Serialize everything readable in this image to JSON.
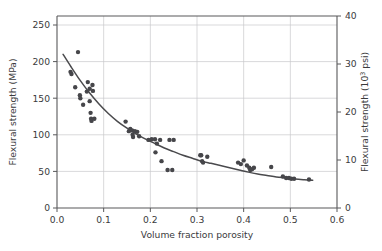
{
  "chart_data": {
    "type": "scatter",
    "title": "",
    "xlabel": "Volume fraction porosity",
    "ylabel_left": "Flexural strength (MPa)",
    "ylabel_right": "Flexural strength (10³ psi)",
    "ylabel_right_base": "Flexural strength (10",
    "ylabel_right_exp": "3",
    "ylabel_right_tail": " psi)",
    "xlim": [
      0.0,
      0.6
    ],
    "ylim_left": [
      0,
      250
    ],
    "ylim_right": [
      0,
      40
    ],
    "grid": true,
    "legend": "none",
    "xticks": [
      0.0,
      0.1,
      0.2,
      0.3,
      0.4,
      0.5,
      0.6
    ],
    "xticklabels": [
      "0.0",
      "0.1",
      "0.2",
      "0.3",
      "0.4",
      "0.5",
      "0.6"
    ],
    "yticks_left": [
      0,
      50,
      100,
      150,
      200,
      250
    ],
    "yticklabels_left": [
      "0",
      "50",
      "100",
      "150",
      "200",
      "250"
    ],
    "yticks_right": [
      0,
      10,
      20,
      30,
      40
    ],
    "yticklabels_right": [
      "0",
      "10",
      "20",
      "30",
      "40"
    ],
    "series": [
      {
        "name": "Flexural strength vs porosity",
        "marker": "circle",
        "color": "#46464a",
        "points": [
          [
            0.029,
            186.0
          ],
          [
            0.031,
            183.0
          ],
          [
            0.039,
            165.0
          ],
          [
            0.045,
            213.0
          ],
          [
            0.049,
            154.0
          ],
          [
            0.05,
            150.0
          ],
          [
            0.056,
            141.0
          ],
          [
            0.064,
            159.0
          ],
          [
            0.066,
            172.0
          ],
          [
            0.07,
            163.0
          ],
          [
            0.07,
            146.0
          ],
          [
            0.072,
            130.0
          ],
          [
            0.073,
            122.0
          ],
          [
            0.074,
            119.0
          ],
          [
            0.076,
            168.0
          ],
          [
            0.077,
            160.0
          ],
          [
            0.08,
            122.0
          ],
          [
            0.147,
            118.0
          ],
          [
            0.154,
            105.0
          ],
          [
            0.157,
            108.0
          ],
          [
            0.161,
            106.0
          ],
          [
            0.162,
            100.0
          ],
          [
            0.163,
            97.0
          ],
          [
            0.167,
            105.0
          ],
          [
            0.172,
            104.0
          ],
          [
            0.176,
            98.0
          ],
          [
            0.196,
            93.0
          ],
          [
            0.203,
            94.0
          ],
          [
            0.21,
            94.0
          ],
          [
            0.211,
            76.0
          ],
          [
            0.214,
            88.0
          ],
          [
            0.221,
            93.0
          ],
          [
            0.224,
            64.0
          ],
          [
            0.237,
            52.0
          ],
          [
            0.241,
            93.0
          ],
          [
            0.247,
            52.0
          ],
          [
            0.25,
            93.0
          ],
          [
            0.307,
            72.0
          ],
          [
            0.309,
            72.0
          ],
          [
            0.311,
            64.0
          ],
          [
            0.313,
            62.0
          ],
          [
            0.322,
            70.0
          ],
          [
            0.388,
            62.0
          ],
          [
            0.394,
            60.0
          ],
          [
            0.4,
            65.0
          ],
          [
            0.407,
            58.0
          ],
          [
            0.412,
            55.0
          ],
          [
            0.414,
            52.0
          ],
          [
            0.418,
            53.0
          ],
          [
            0.422,
            55.0
          ],
          [
            0.459,
            56.0
          ],
          [
            0.484,
            43.0
          ],
          [
            0.491,
            41.0
          ],
          [
            0.497,
            41.0
          ],
          [
            0.502,
            40.0
          ],
          [
            0.508,
            40.0
          ],
          [
            0.54,
            39.0
          ]
        ]
      }
    ],
    "fit_curve": {
      "name": "exponential fit",
      "color": "#4a4a4d",
      "points": [
        [
          0.013,
          210.0
        ],
        [
          0.03,
          193.0
        ],
        [
          0.05,
          174.0
        ],
        [
          0.07,
          157.0
        ],
        [
          0.09,
          142.0
        ],
        [
          0.11,
          129.0
        ],
        [
          0.13,
          118.0
        ],
        [
          0.15,
          109.0
        ],
        [
          0.17,
          101.0
        ],
        [
          0.19,
          94.0
        ],
        [
          0.21,
          88.0
        ],
        [
          0.23,
          82.0
        ],
        [
          0.25,
          77.0
        ],
        [
          0.27,
          72.0
        ],
        [
          0.29,
          68.0
        ],
        [
          0.31,
          64.0
        ],
        [
          0.33,
          61.0
        ],
        [
          0.35,
          58.0
        ],
        [
          0.37,
          55.0
        ],
        [
          0.39,
          52.0
        ],
        [
          0.41,
          49.0
        ],
        [
          0.43,
          46.5
        ],
        [
          0.45,
          44.5
        ],
        [
          0.47,
          42.5
        ],
        [
          0.49,
          41.0
        ],
        [
          0.51,
          39.5
        ],
        [
          0.53,
          38.5
        ],
        [
          0.548,
          37.8
        ]
      ]
    }
  }
}
